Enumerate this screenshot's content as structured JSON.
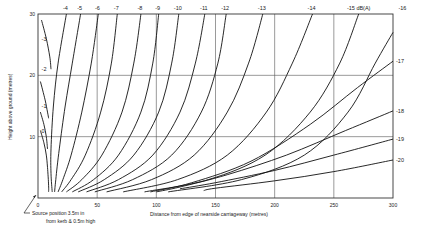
{
  "chart_data": {
    "type": "line",
    "title": "",
    "xlabel": "Distance from edge of nearside carriageway (metres)",
    "ylabel": "Height above ground (metres)",
    "xlim": [
      0,
      300
    ],
    "ylim": [
      0,
      30
    ],
    "x_ticks": [
      "0",
      "50",
      "100",
      "150",
      "200",
      "250",
      "300"
    ],
    "y_ticks": [
      "10",
      "20",
      "30"
    ],
    "grid": {
      "x": [
        50,
        100,
        150,
        200,
        250
      ],
      "y": [
        10,
        20
      ]
    },
    "unit_label": "dB(A)",
    "annotation": {
      "line1": "Source position 3.5m in",
      "line2": "from kerb & 0.5m high"
    },
    "series": [
      {
        "name": "-3",
        "label_pos": "left",
        "points": [
          [
            3,
            29
          ],
          [
            7,
            26
          ],
          [
            10,
            23
          ],
          [
            11,
            21
          ]
        ]
      },
      {
        "name": "-2",
        "label_pos": "left",
        "points": [
          [
            2,
            19
          ],
          [
            6,
            16
          ],
          [
            8,
            14
          ],
          [
            9,
            13
          ]
        ]
      },
      {
        "name": "-1",
        "label_pos": "left",
        "points": [
          [
            2,
            14
          ],
          [
            5,
            12
          ],
          [
            7,
            10
          ],
          [
            8,
            8
          ]
        ]
      },
      {
        "name": "0",
        "label_pos": "left",
        "points": [
          [
            2,
            11
          ],
          [
            5,
            9
          ],
          [
            7,
            7
          ],
          [
            8,
            5
          ],
          [
            9,
            2
          ],
          [
            9,
            1
          ]
        ]
      },
      {
        "name": "-4",
        "label_pos": "top",
        "points": [
          [
            24,
            30
          ],
          [
            17,
            22
          ],
          [
            13,
            15
          ],
          [
            11,
            8
          ],
          [
            11,
            4
          ],
          [
            12,
            1
          ]
        ]
      },
      {
        "name": "-5",
        "label_pos": "top",
        "points": [
          [
            36,
            30
          ],
          [
            29,
            22
          ],
          [
            23,
            15
          ],
          [
            18,
            8
          ],
          [
            15,
            3
          ],
          [
            14,
            1
          ]
        ]
      },
      {
        "name": "-6",
        "label_pos": "top",
        "points": [
          [
            51,
            30
          ],
          [
            45,
            22
          ],
          [
            37,
            14
          ],
          [
            28,
            7
          ],
          [
            21,
            3
          ],
          [
            17,
            1
          ]
        ]
      },
      {
        "name": "-7",
        "label_pos": "top",
        "points": [
          [
            67,
            30
          ],
          [
            62,
            22
          ],
          [
            53,
            14
          ],
          [
            40,
            7
          ],
          [
            28,
            3
          ],
          [
            20,
            1
          ]
        ]
      },
      {
        "name": "-8",
        "label_pos": "top",
        "points": [
          [
            87,
            30
          ],
          [
            81,
            22
          ],
          [
            71,
            14
          ],
          [
            54,
            7
          ],
          [
            37,
            3
          ],
          [
            24,
            1
          ]
        ]
      },
      {
        "name": "-9",
        "label_pos": "top",
        "points": [
          [
            102,
            30
          ],
          [
            97,
            22
          ],
          [
            87,
            14
          ],
          [
            68,
            7
          ],
          [
            47,
            3
          ],
          [
            29,
            1
          ]
        ]
      },
      {
        "name": "-10",
        "label_pos": "top",
        "points": [
          [
            119,
            30
          ],
          [
            113,
            22
          ],
          [
            102,
            14
          ],
          [
            81,
            7
          ],
          [
            56,
            3
          ],
          [
            34,
            1
          ]
        ]
      },
      {
        "name": "-11",
        "label_pos": "top",
        "points": [
          [
            141,
            30
          ],
          [
            133,
            22
          ],
          [
            120,
            14
          ],
          [
            97,
            7
          ],
          [
            68,
            3
          ],
          [
            41,
            1
          ]
        ]
      },
      {
        "name": "-12",
        "label_pos": "top",
        "points": [
          [
            159,
            30
          ],
          [
            152,
            22
          ],
          [
            138,
            14
          ],
          [
            113,
            7
          ],
          [
            80,
            3
          ],
          [
            48,
            1
          ]
        ]
      },
      {
        "name": "-13",
        "label_pos": "top",
        "points": [
          [
            190,
            30
          ],
          [
            178,
            22
          ],
          [
            160,
            14
          ],
          [
            132,
            7
          ],
          [
            96,
            3
          ],
          [
            58,
            1
          ]
        ]
      },
      {
        "name": "-14",
        "label_pos": "top",
        "points": [
          [
            232,
            30
          ],
          [
            215,
            22
          ],
          [
            193,
            14
          ],
          [
            160,
            7
          ],
          [
            118,
            3
          ],
          [
            72,
            1
          ]
        ]
      },
      {
        "name": "-15",
        "label_pos": "top",
        "points": [
          [
            271,
            30
          ],
          [
            255,
            22
          ],
          [
            230,
            14
          ],
          [
            192,
            7
          ],
          [
            144,
            3
          ],
          [
            90,
            1
          ]
        ]
      },
      {
        "name": "-16",
        "label_pos": "top",
        "points": [
          [
            300,
            27
          ],
          [
            285,
            22
          ],
          [
            262,
            14
          ],
          [
            225,
            7
          ],
          [
            172,
            3
          ],
          [
            110,
            1
          ]
        ]
      },
      {
        "name": "-17",
        "label_pos": "right",
        "points": [
          [
            300,
            22.3
          ],
          [
            270,
            18
          ],
          [
            230,
            12
          ],
          [
            180,
            6
          ],
          [
            130,
            2.5
          ],
          [
            95,
            1
          ]
        ]
      },
      {
        "name": "-18",
        "label_pos": "right",
        "points": [
          [
            300,
            14.2
          ],
          [
            260,
            11
          ],
          [
            210,
            7
          ],
          [
            160,
            3.8
          ],
          [
            120,
            1.8
          ],
          [
            100,
            1
          ]
        ]
      },
      {
        "name": "-19",
        "label_pos": "right",
        "points": [
          [
            300,
            9.6
          ],
          [
            250,
            7
          ],
          [
            200,
            4.5
          ],
          [
            150,
            2.5
          ],
          [
            120,
            1.5
          ]
        ]
      },
      {
        "name": "-20",
        "label_pos": "right",
        "points": [
          [
            300,
            6.2
          ],
          [
            250,
            4.3
          ],
          [
            200,
            2.8
          ],
          [
            150,
            1.6
          ],
          [
            140,
            1.2
          ]
        ]
      }
    ]
  }
}
